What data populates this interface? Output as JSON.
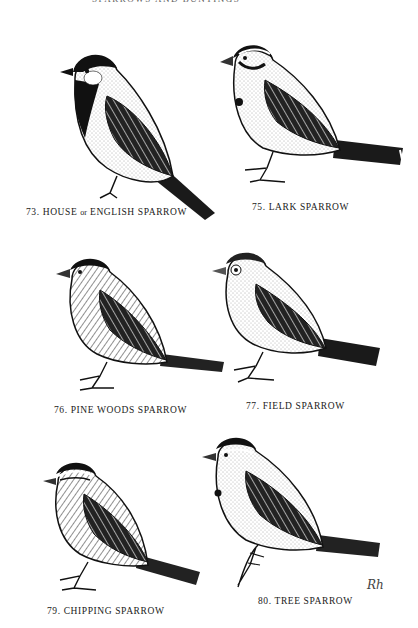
{
  "page": {
    "running_head": "SPARROWS AND BUNTINGS",
    "artist_signature": "Rh"
  },
  "plates": [
    {
      "number": "73.",
      "name_pre": "HOUSE",
      "name_joiner": "or",
      "name_post": "ENGLISH SPARROW",
      "label": "73. HOUSE or ENGLISH SPARROW"
    },
    {
      "number": "75.",
      "name": "LARK SPARROW",
      "label": "75. LARK SPARROW"
    },
    {
      "number": "76.",
      "name": "PINE WOODS SPARROW",
      "label": "76. PINE WOODS SPARROW"
    },
    {
      "number": "77.",
      "name": "FIELD SPARROW",
      "label": "77. FIELD SPARROW"
    },
    {
      "number": "79.",
      "name": "CHIPPING SPARROW",
      "label": "79. CHIPPING SPARROW"
    },
    {
      "number": "80.",
      "name": "TREE SPARROW",
      "label": "80. TREE SPARROW"
    }
  ],
  "colors": {
    "ink": "#111111",
    "paper": "#ffffff",
    "stipple": "#555555"
  }
}
